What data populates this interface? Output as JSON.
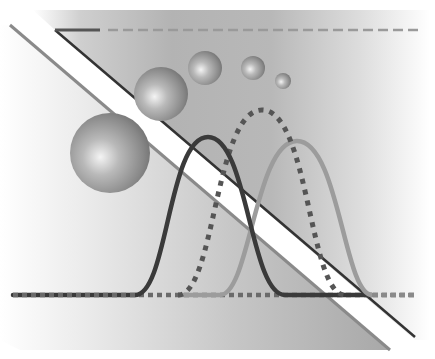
{
  "illustration": {
    "description": "Abstract grayscale diagram: gray panel split by a white diagonal band, five shaded spheres of decreasing size, three bell curves (dark solid, dotted, light solid) on a shared baseline, and a solid-to-dashed top rule",
    "colors": {
      "background": "#ffffff",
      "panel_center": "#a9a9a9",
      "panel_edge": "#ffffff",
      "band": "#ffffff",
      "band_upper_line": "#333333",
      "band_lower_line": "#8a8a8a",
      "top_rule_solid": "#555555",
      "top_rule_dashed": "#9a9a9a",
      "curve_dark": "#3a3a3a",
      "curve_dotted": "#555555",
      "curve_light": "#9c9c9c",
      "sphere_highlight": "#f2f2f2",
      "sphere_shadow": "#6e6e6e"
    },
    "top_rule": {
      "y": 30,
      "solid_from": 55,
      "solid_to": 100,
      "dashed_from": 108,
      "dashed_to": 418
    },
    "spheres": [
      {
        "cx": 110,
        "cy": 153,
        "r": 40
      },
      {
        "cx": 161,
        "cy": 94,
        "r": 27
      },
      {
        "cx": 205,
        "cy": 68,
        "r": 17
      },
      {
        "cx": 253,
        "cy": 68,
        "r": 12
      },
      {
        "cx": 283,
        "cy": 81,
        "r": 8
      }
    ],
    "baseline": {
      "y": 295,
      "x_from": 13,
      "x_to": 415
    },
    "curves": [
      {
        "name": "dark",
        "start": 135,
        "peak_x": 208,
        "peak_y": 137,
        "end": 285
      },
      {
        "name": "dotted",
        "start": 178,
        "peak_x": 262,
        "peak_y": 110,
        "end": 345
      },
      {
        "name": "light",
        "start": 220,
        "peak_x": 297,
        "peak_y": 141,
        "end": 372
      }
    ]
  }
}
